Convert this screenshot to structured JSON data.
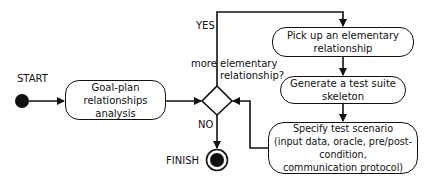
{
  "diagram": {
    "type": "activity-flowchart",
    "start_label": "START",
    "finish_label": "FINISH",
    "nodes": {
      "goal_plan": {
        "lines": [
          "Goal-plan relationships",
          "analysis"
        ]
      },
      "pick_up": {
        "lines": [
          "Pick up an elementary relationship"
        ]
      },
      "generate": {
        "lines": [
          "Generate a test suite skeleton"
        ]
      },
      "specify": {
        "lines": [
          "Specify test scenario",
          "(input data, oracle, pre/post-condition,",
          "communication protocol)"
        ]
      }
    },
    "decision": {
      "question_line1_left": "more",
      "question_line1_right": "elementary",
      "question_line2": "relationship?",
      "yes_label": "YES",
      "no_label": "NO"
    },
    "edges": [
      {
        "from": "START",
        "to": "goal_plan"
      },
      {
        "from": "goal_plan",
        "to": "decision"
      },
      {
        "from": "decision",
        "to": "pick_up",
        "label": "YES"
      },
      {
        "from": "pick_up",
        "to": "generate"
      },
      {
        "from": "generate",
        "to": "specify"
      },
      {
        "from": "specify",
        "to": "decision"
      },
      {
        "from": "decision",
        "to": "FINISH",
        "label": "NO"
      }
    ],
    "colors": {
      "stroke": "#111111",
      "background": "#ffffff"
    }
  }
}
